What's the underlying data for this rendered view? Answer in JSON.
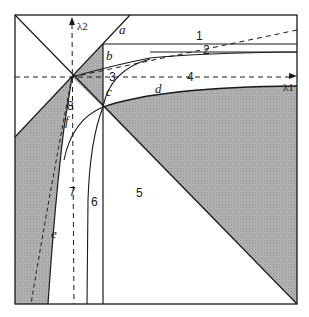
{
  "diagram": {
    "type": "phase-region diagram",
    "axes": {
      "x_label": "λ1",
      "y_label": "λ2"
    },
    "region_labels": [
      "1",
      "2",
      "3",
      "4",
      "5",
      "6",
      "7",
      "8"
    ],
    "curve_labels": [
      "a",
      "b",
      "c",
      "d",
      "e",
      "f"
    ],
    "colors": {
      "line": "#1a1a1a",
      "shade": "#a8a8a8",
      "background": "#ffffff"
    }
  }
}
